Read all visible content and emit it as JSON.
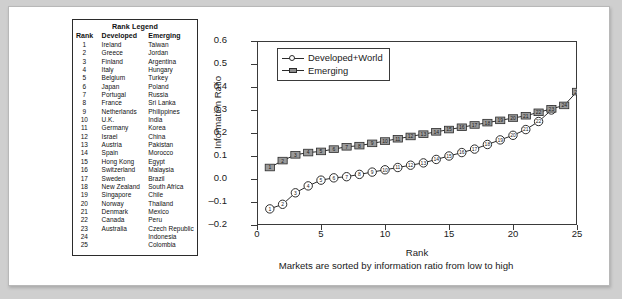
{
  "legend_table": {
    "title": "Rank Legend",
    "columns": [
      "Rank",
      "Developed",
      "Emerging"
    ],
    "rows": [
      [
        "1",
        "Ireland",
        "Taiwan"
      ],
      [
        "2",
        "Greece",
        "Jordan"
      ],
      [
        "3",
        "Finland",
        "Argentina"
      ],
      [
        "4",
        "Italy",
        "Hungary"
      ],
      [
        "5",
        "Belgium",
        "Turkey"
      ],
      [
        "6",
        "Japan",
        "Poland"
      ],
      [
        "7",
        "Portugal",
        "Russia"
      ],
      [
        "8",
        "France",
        "Sri Lanka"
      ],
      [
        "9",
        "Netherlands",
        "Philippines"
      ],
      [
        "10",
        "U.K.",
        "India"
      ],
      [
        "11",
        "Germany",
        "Korea"
      ],
      [
        "12",
        "Israel",
        "China"
      ],
      [
        "13",
        "Austria",
        "Pakistan"
      ],
      [
        "14",
        "Spain",
        "Morocco"
      ],
      [
        "15",
        "Hong Kong",
        "Egypt"
      ],
      [
        "16",
        "Switzerland",
        "Malaysia"
      ],
      [
        "17",
        "Sweden",
        "Brazil"
      ],
      [
        "18",
        "New Zealand",
        "South Africa"
      ],
      [
        "19",
        "Singapore",
        "Chile"
      ],
      [
        "20",
        "Norway",
        "Thailand"
      ],
      [
        "21",
        "Denmark",
        "Mexico"
      ],
      [
        "22",
        "Canada",
        "Peru"
      ],
      [
        "23",
        "Australia",
        "Czech Republic"
      ],
      [
        "24",
        "",
        "Indonesia"
      ],
      [
        "25",
        "",
        "Colombia"
      ]
    ]
  },
  "chart_data": {
    "type": "line",
    "title": "",
    "xlabel": "Rank",
    "ylabel": "Information Ratio",
    "caption": "Markets are sorted by information ratio from low to high",
    "xlim": [
      0,
      25
    ],
    "ylim": [
      -0.2,
      0.6
    ],
    "xticks": [
      0,
      5,
      10,
      15,
      20,
      25
    ],
    "xtick_labels": [
      "0",
      "5",
      "10",
      "15",
      "20",
      "25"
    ],
    "yticks": [
      -0.2,
      -0.1,
      0.0,
      0.1,
      0.2,
      0.3,
      0.4,
      0.5,
      0.6
    ],
    "ytick_labels": [
      "-0.2",
      "-0.1",
      "0.0",
      "0.1",
      "0.2",
      "0.3",
      "0.4",
      "0.5",
      "0.6"
    ],
    "grid": false,
    "legend_position": "upper-left",
    "marker_labels": true,
    "series": [
      {
        "name": "Developed+World",
        "marker": "circle-open",
        "color": "#2b2b2b",
        "x": [
          1,
          2,
          3,
          4,
          5,
          6,
          7,
          8,
          9,
          10,
          11,
          12,
          13,
          14,
          15,
          16,
          17,
          18,
          19,
          20,
          21,
          22,
          23
        ],
        "values": [
          -0.13,
          -0.11,
          -0.06,
          -0.03,
          -0.005,
          0.005,
          0.01,
          0.02,
          0.03,
          0.04,
          0.05,
          0.06,
          0.07,
          0.085,
          0.1,
          0.115,
          0.13,
          0.15,
          0.17,
          0.19,
          0.215,
          0.25,
          0.3
        ]
      },
      {
        "name": "Emerging",
        "marker": "square-filled",
        "color": "#8d8d8d",
        "x": [
          1,
          2,
          3,
          4,
          5,
          6,
          7,
          8,
          9,
          10,
          11,
          12,
          13,
          14,
          15,
          16,
          17,
          18,
          19,
          20,
          21,
          22,
          23,
          24,
          25
        ],
        "values": [
          0.05,
          0.08,
          0.105,
          0.115,
          0.12,
          0.13,
          0.14,
          0.145,
          0.155,
          0.165,
          0.175,
          0.185,
          0.195,
          0.205,
          0.215,
          0.225,
          0.235,
          0.245,
          0.255,
          0.265,
          0.275,
          0.29,
          0.305,
          0.32,
          0.38
        ]
      }
    ]
  }
}
